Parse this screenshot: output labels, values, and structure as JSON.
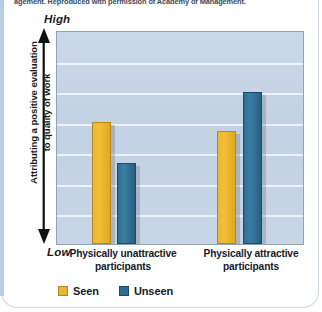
{
  "figure": {
    "credit_line": "agement. Reproduced with permission of Academy of Management.",
    "left_rule_color": "#b9cde0",
    "card_background": "#ffffff"
  },
  "axis": {
    "high_label": "High",
    "low_label": "Low",
    "y_caption_line1": "Attributing a positive evaluation",
    "y_caption_line2": "to quality of work",
    "arrow_icon": "double-headed-vertical-arrow-icon"
  },
  "legend": {
    "position": "bottom-left",
    "items": [
      {
        "label": "Seen",
        "color": "#eab733",
        "swatch_icon": "legend-swatch-seen"
      },
      {
        "label": "Unseen",
        "color": "#2f6e92",
        "swatch_icon": "legend-swatch-unseen"
      }
    ]
  },
  "categories_wrapped": [
    {
      "line1": "Physically unattractive",
      "line2": "participants"
    },
    {
      "line1": "Physically attractive",
      "line2": "participants"
    }
  ],
  "chart_data": {
    "type": "bar",
    "title": "",
    "subtitle": "",
    "xlabel": "",
    "ylabel": "Attributing a positive evaluation to quality of work",
    "categories": [
      "Physically unattractive participants",
      "Physically attractive participants"
    ],
    "series": [
      {
        "name": "Seen",
        "color": "#eab733",
        "values": [
          57,
          53
        ]
      },
      {
        "name": "Unseen",
        "color": "#2f6e92",
        "values": [
          38,
          71
        ]
      }
    ],
    "ylim": [
      0,
      100
    ],
    "ytick_labels": [
      "Low",
      "High"
    ],
    "grid": true,
    "gridline_count": 6,
    "legend_position": "bottom-left",
    "plot_background": "#c5d3e2",
    "annotations": []
  },
  "geometry": {
    "plot_width": 248,
    "plot_height": 214,
    "bar_width_px": 19,
    "bar_positions_px": [
      35,
      60,
      160,
      186
    ]
  }
}
